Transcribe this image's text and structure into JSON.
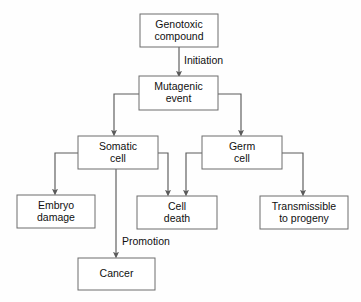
{
  "diagram": {
    "type": "flowchart",
    "orientation": "top-down",
    "colors": {
      "box_fill": "#ffffff",
      "box_stroke": "#6d6d6d",
      "line": "#5a5a5a",
      "text": "#101010",
      "background": "#fefefe"
    },
    "nodes": [
      {
        "id": "genotoxic-compound",
        "line1": "Genotoxic",
        "line2": "compound",
        "x": 140,
        "y": 14,
        "w": 78,
        "h": 33
      },
      {
        "id": "mutagenic-event",
        "line1": "Mutagenic",
        "line2": "event",
        "x": 139,
        "y": 76,
        "w": 79,
        "h": 34
      },
      {
        "id": "somatic-cell",
        "line1": "Somatic",
        "line2": "cell",
        "x": 78,
        "y": 136,
        "w": 80,
        "h": 33
      },
      {
        "id": "germ-cell",
        "line1": "Germ",
        "line2": "cell",
        "x": 202,
        "y": 136,
        "w": 80,
        "h": 33
      },
      {
        "id": "embryo-damage",
        "line1": "Embryo",
        "line2": "damage",
        "x": 17,
        "y": 195,
        "w": 78,
        "h": 33
      },
      {
        "id": "cell-death",
        "line1": "Cell",
        "line2": "death",
        "x": 137,
        "y": 196,
        "w": 80,
        "h": 33
      },
      {
        "id": "transmissible-to-progeny",
        "line1": "Transmissible",
        "line2": "to progeny",
        "x": 260,
        "y": 196,
        "w": 88,
        "h": 33
      },
      {
        "id": "cancer",
        "line1": "Cancer",
        "line2": "",
        "x": 78,
        "y": 258,
        "w": 77,
        "h": 32
      }
    ],
    "edge_labels": [
      {
        "id": "initiation",
        "text": "Initiation",
        "x": 184,
        "y": 61
      },
      {
        "id": "promotion",
        "text": "Promotion",
        "x": 122,
        "y": 242
      }
    ],
    "edges": [
      {
        "id": "genotoxic-to-mutagenic",
        "from": "genotoxic-compound",
        "to": "mutagenic-event",
        "label": "Initiation"
      },
      {
        "id": "mutagenic-to-somatic",
        "from": "mutagenic-event",
        "to": "somatic-cell",
        "label": ""
      },
      {
        "id": "mutagenic-to-germ",
        "from": "mutagenic-event",
        "to": "germ-cell",
        "label": ""
      },
      {
        "id": "somatic-to-embryo",
        "from": "somatic-cell",
        "to": "embryo-damage",
        "label": ""
      },
      {
        "id": "somatic-to-celldeath",
        "from": "somatic-cell",
        "to": "cell-death",
        "label": ""
      },
      {
        "id": "somatic-to-cancer",
        "from": "somatic-cell",
        "to": "cancer",
        "label": "Promotion"
      },
      {
        "id": "germ-to-celldeath",
        "from": "germ-cell",
        "to": "cell-death",
        "label": ""
      },
      {
        "id": "germ-to-transmissible",
        "from": "germ-cell",
        "to": "transmissible-to-progeny",
        "label": ""
      }
    ]
  }
}
